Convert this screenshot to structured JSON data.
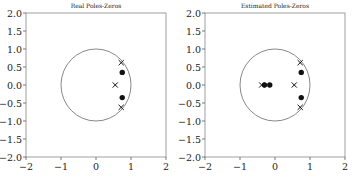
{
  "chart_data": [
    {
      "type": "scatter",
      "title": "Real Poles-Zeros",
      "xlabel": "",
      "ylabel": "",
      "xlim": [
        -2,
        2
      ],
      "ylim": [
        -2,
        2
      ],
      "xticks": [
        "-2",
        "-1",
        "0",
        "1",
        "2"
      ],
      "yticks": [
        "2.0",
        "1.5",
        "1.0",
        "0.5",
        "0.0",
        "-0.5",
        "-1.0",
        "-1.5",
        "-2.0"
      ],
      "grid": false,
      "unit_circle": true,
      "series": [
        {
          "name": "poles",
          "marker": "x",
          "points": [
            [
              0.72,
              0.62
            ],
            [
              0.72,
              -0.62
            ],
            [
              0.55,
              0.0
            ]
          ]
        },
        {
          "name": "zeros",
          "marker": "o",
          "points": [
            [
              0.75,
              0.35
            ],
            [
              0.75,
              -0.35
            ]
          ]
        }
      ]
    },
    {
      "type": "scatter",
      "title": "Estimated Poles-Zeros",
      "xlabel": "",
      "ylabel": "",
      "xlim": [
        -2,
        2
      ],
      "ylim": [
        -2,
        2
      ],
      "xticks": [
        "-2",
        "-1",
        "0",
        "1",
        "2"
      ],
      "yticks": [
        "2.0",
        "1.5",
        "1.0",
        "0.5",
        "0.0",
        "-0.5",
        "-1.0",
        "-1.5",
        "-2.0"
      ],
      "grid": false,
      "unit_circle": true,
      "series": [
        {
          "name": "poles",
          "marker": "x",
          "points": [
            [
              0.72,
              0.62
            ],
            [
              0.72,
              -0.62
            ],
            [
              0.55,
              0.0
            ],
            [
              -0.38,
              0.0
            ]
          ]
        },
        {
          "name": "zeros",
          "marker": "o",
          "points": [
            [
              0.75,
              0.35
            ],
            [
              0.75,
              -0.35
            ],
            [
              -0.3,
              0.0
            ],
            [
              -0.15,
              0.0
            ]
          ]
        }
      ]
    }
  ]
}
